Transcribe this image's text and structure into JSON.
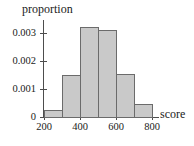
{
  "chart_data": {
    "type": "bar",
    "title": "",
    "subtitle": "",
    "xlabel": "score",
    "ylabel": "proportion",
    "grid": false,
    "legend": false,
    "legend_position": "none",
    "histogram": true,
    "bin_width": 100,
    "bin_edges": [
      200,
      300,
      400,
      500,
      600,
      700,
      800
    ],
    "categories": [
      "200-300",
      "300-400",
      "400-500",
      "500-600",
      "600-700",
      "700-800"
    ],
    "values": [
      0.00025,
      0.0015,
      0.0032,
      0.0031,
      0.00155,
      0.00045
    ],
    "xlim": [
      200,
      800
    ],
    "ylim": [
      0,
      0.0035
    ],
    "xticks": [
      200,
      400,
      600,
      800
    ],
    "xtick_labels": [
      "200",
      "400",
      "600",
      "800"
    ],
    "yticks": [
      0,
      0.001,
      0.002,
      0.003
    ],
    "ytick_labels": [
      "0",
      "0.001",
      "0.002",
      "0.003"
    ],
    "bar_fill_color": "#c9c9c9",
    "bar_edge_color": "#6b6b6b",
    "axis_color": "#4d4d4d",
    "text_color": "#1a1a1a",
    "background_color": "#ffffff"
  }
}
